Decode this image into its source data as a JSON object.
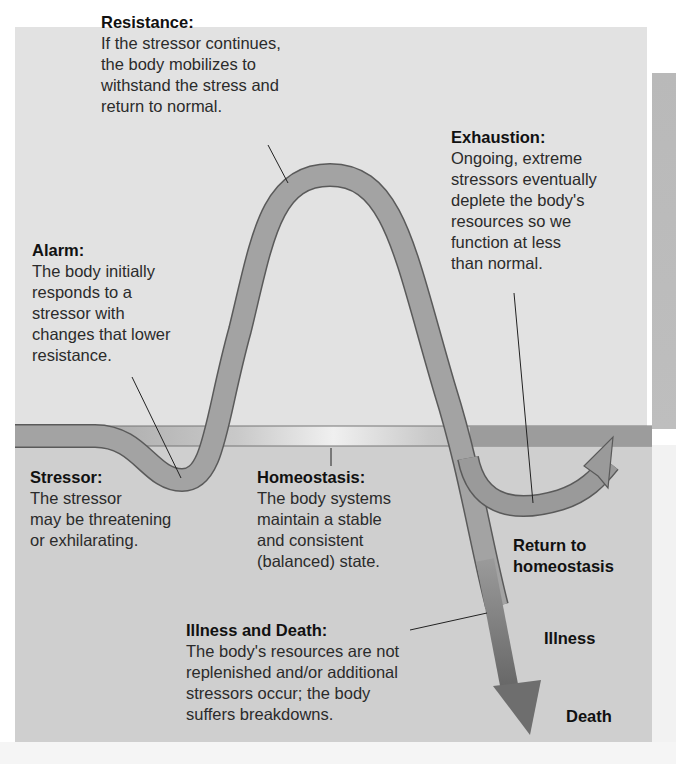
{
  "diagram": {
    "type": "General Adaptation Syndrome stress response curve",
    "colors": {
      "background_upper": "#e2e2e2",
      "background_lower": "#cfcfcf",
      "homeostasis_band": "#9e9e9e",
      "curve_fill": "#9a9a9a",
      "curve_outline": "#555555",
      "arrow_dark": "#6f6f6f",
      "text": "#2b2b2b"
    },
    "stages": {
      "resistance": {
        "title": "Resistance:",
        "body": "If the stressor continues,\nthe body mobilizes to\nwithstand the stress and\nreturn to normal."
      },
      "exhaustion": {
        "title": "Exhaustion:",
        "body": "Ongoing, extreme\nstressors eventually\ndeplete the body's\nresources so we\nfunction at less\nthan normal."
      },
      "alarm": {
        "title": "Alarm:",
        "body": "The body initially\nresponds to a\nstressor with\nchanges that lower\nresistance."
      },
      "stressor": {
        "title": "Stressor:",
        "body": "The stressor\nmay be threatening\nor exhilarating."
      },
      "homeostasis": {
        "title": "Homeostasis:",
        "body": "The body systems\nmaintain a stable\nand consistent\n(balanced) state."
      },
      "illness_and_death": {
        "title": "Illness and Death:",
        "body": "The body's resources are not\nreplenished and/or additional\nstressors occur; the body\nsuffers breakdowns."
      }
    },
    "outcomes": {
      "return": "Return to\nhomeostasis",
      "illness": "Illness",
      "death": "Death"
    }
  }
}
